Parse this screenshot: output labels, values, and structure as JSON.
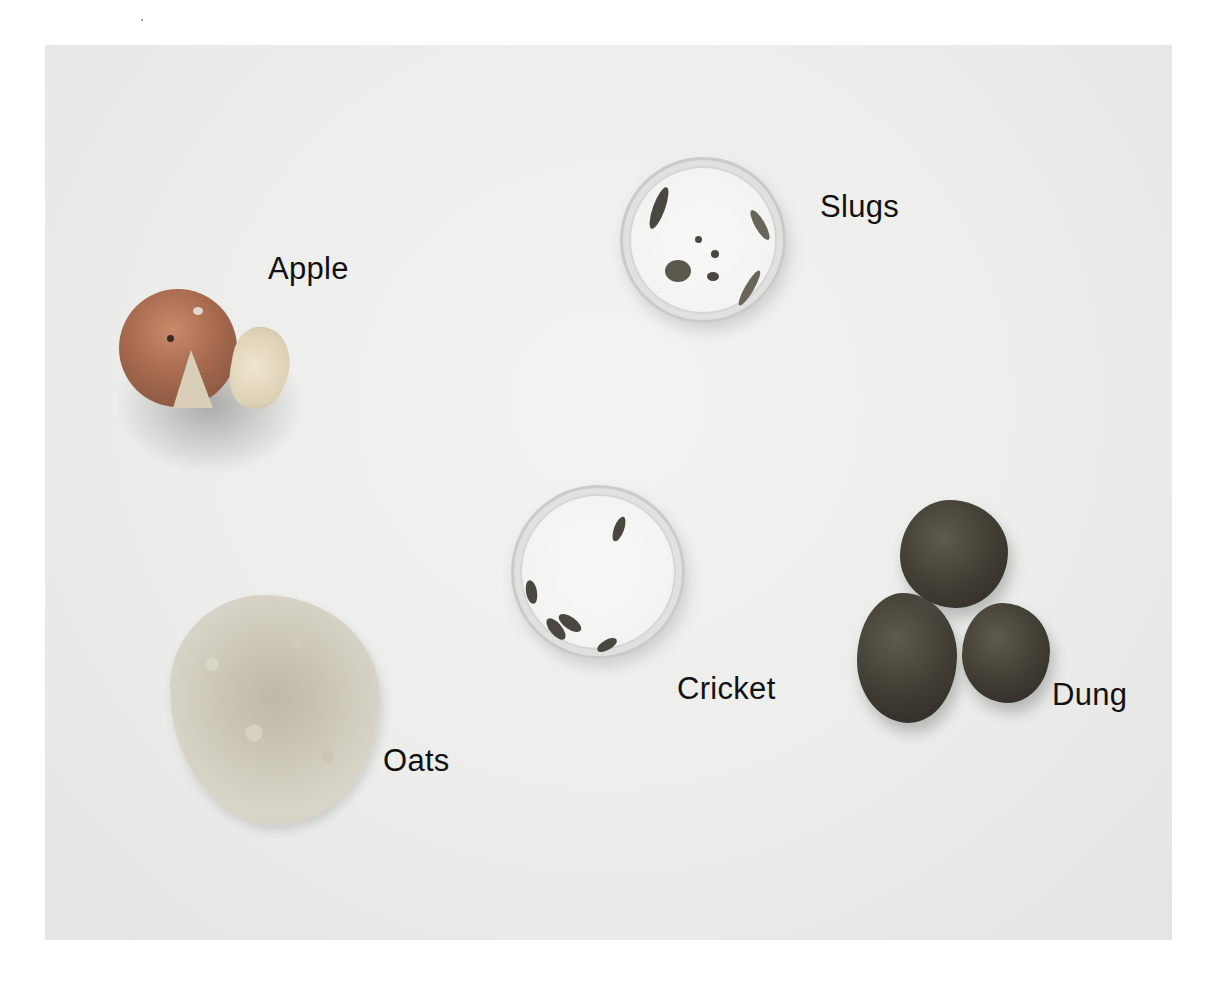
{
  "image": {
    "description": "Photograph of food items arranged on a white surface, each with a text label",
    "background_color": "#ececea"
  },
  "labels": {
    "apple": "Apple",
    "slugs": "Slugs",
    "cricket": "Cricket",
    "dung": "Dung",
    "oats": "Oats"
  },
  "items": [
    {
      "name": "Apple",
      "depiction": "whole apple with wedge cut out and separate slice"
    },
    {
      "name": "Slugs",
      "depiction": "petri dish containing several slugs and debris"
    },
    {
      "name": "Cricket",
      "depiction": "petri dish containing five crickets"
    },
    {
      "name": "Dung",
      "depiction": "three fibrous dung pellets"
    },
    {
      "name": "Oats",
      "depiction": "pile of rolled oats"
    }
  ]
}
